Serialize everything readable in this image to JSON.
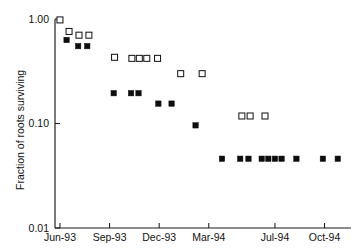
{
  "chart_data": {
    "type": "scatter",
    "title": "",
    "xlabel": "",
    "ylabel": "Fraction of roots surviving",
    "yscale": "log",
    "ylim": [
      0.01,
      1.0
    ],
    "ytick_labels": [
      "1.00",
      "0.10",
      "0.01"
    ],
    "ytick_values": [
      1.0,
      0.1,
      0.01
    ],
    "xtick_labels": [
      "Jun-93",
      "Sep-93",
      "Dec-93",
      "Mar-94",
      "Jul-94",
      "Oct-94"
    ],
    "xtick_months": [
      0,
      3,
      6,
      9,
      13,
      16
    ],
    "xlim_months": [
      -0.3,
      17.6
    ],
    "grid": false,
    "legend": null,
    "series": [
      {
        "name": "open-squares",
        "marker": "open-square",
        "points": [
          {
            "x_month": 0.0,
            "date": "Jun-93",
            "y": 0.98
          },
          {
            "x_month": 0.55,
            "date": "Jun-93",
            "y": 0.76
          },
          {
            "x_month": 1.15,
            "date": "Jul-93",
            "y": 0.7
          },
          {
            "x_month": 1.75,
            "date": "Jul-93",
            "y": 0.7
          },
          {
            "x_month": 3.3,
            "date": "Sep-93",
            "y": 0.43
          },
          {
            "x_month": 4.35,
            "date": "Oct-93",
            "y": 0.42
          },
          {
            "x_month": 4.8,
            "date": "Oct-93",
            "y": 0.42
          },
          {
            "x_month": 5.25,
            "date": "Nov-93",
            "y": 0.42
          },
          {
            "x_month": 5.9,
            "date": "Nov-93",
            "y": 0.42
          },
          {
            "x_month": 7.3,
            "date": "Jan-94",
            "y": 0.3
          },
          {
            "x_month": 8.6,
            "date": "Feb-94",
            "y": 0.3
          },
          {
            "x_month": 11.0,
            "date": "May-94",
            "y": 0.118
          },
          {
            "x_month": 11.5,
            "date": "May-94",
            "y": 0.118
          },
          {
            "x_month": 12.4,
            "date": "Jun-94",
            "y": 0.118
          }
        ]
      },
      {
        "name": "filled-squares",
        "marker": "filled-square",
        "points": [
          {
            "x_month": 0.4,
            "date": "Jun-93",
            "y": 0.63
          },
          {
            "x_month": 1.1,
            "date": "Jul-93",
            "y": 0.55
          },
          {
            "x_month": 1.65,
            "date": "Jul-93",
            "y": 0.55
          },
          {
            "x_month": 3.25,
            "date": "Sep-93",
            "y": 0.195
          },
          {
            "x_month": 4.3,
            "date": "Oct-93",
            "y": 0.195
          },
          {
            "x_month": 4.75,
            "date": "Oct-93",
            "y": 0.195
          },
          {
            "x_month": 5.95,
            "date": "Nov-93",
            "y": 0.155
          },
          {
            "x_month": 6.75,
            "date": "Dec-93",
            "y": 0.155
          },
          {
            "x_month": 8.2,
            "date": "Feb-94",
            "y": 0.096
          },
          {
            "x_month": 9.8,
            "date": "Mar-94",
            "y": 0.046
          },
          {
            "x_month": 10.9,
            "date": "Apr-94",
            "y": 0.046
          },
          {
            "x_month": 11.4,
            "date": "May-94",
            "y": 0.046
          },
          {
            "x_month": 12.2,
            "date": "Jun-94",
            "y": 0.046
          },
          {
            "x_month": 12.6,
            "date": "Jun-94",
            "y": 0.046
          },
          {
            "x_month": 13.0,
            "date": "Jul-94",
            "y": 0.046
          },
          {
            "x_month": 13.4,
            "date": "Jul-94",
            "y": 0.046
          },
          {
            "x_month": 14.3,
            "date": "Aug-94",
            "y": 0.046
          },
          {
            "x_month": 15.9,
            "date": "Sep-94",
            "y": 0.046
          },
          {
            "x_month": 16.8,
            "date": "Oct-94",
            "y": 0.046
          }
        ]
      }
    ]
  },
  "axes": {
    "y_axis_label": "Fraction of roots surviving",
    "y_ticks": [
      {
        "label": "1.00",
        "value": 1.0
      },
      {
        "label": "0.10",
        "value": 0.1
      },
      {
        "label": "0.01",
        "value": 0.01
      }
    ],
    "x_ticks": [
      {
        "label": "Jun-93",
        "month": 0
      },
      {
        "label": "Sep-93",
        "month": 3
      },
      {
        "label": "Dec-93",
        "month": 6
      },
      {
        "label": "Mar-94",
        "month": 9
      },
      {
        "label": "Jul-94",
        "month": 13
      },
      {
        "label": "Oct-94",
        "month": 16
      }
    ]
  },
  "style": {
    "axis_color": "#1a1a1a",
    "open_marker_fill": "#ffffff",
    "open_marker_stroke": "#1a1a1a",
    "filled_marker_fill": "#0d0d0d",
    "background": "#ffffff"
  }
}
